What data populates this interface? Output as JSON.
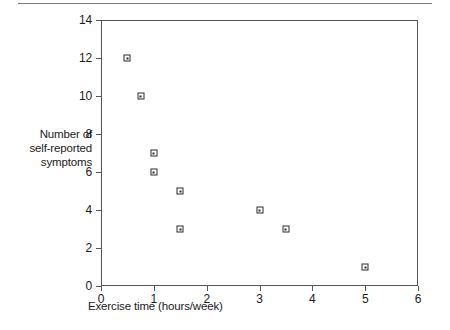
{
  "figure": {
    "top_rule": "horizontal-rule"
  },
  "chart_data": {
    "type": "scatter",
    "title": "",
    "xlabel": "Exercise time (hours/week)",
    "ylabel": "Number of\nself-reported\nsymptoms",
    "ylabel_lines": [
      "Number of",
      "self-reported",
      "symptoms"
    ],
    "xlim": [
      0,
      6
    ],
    "ylim": [
      0,
      14
    ],
    "xticks": [
      0,
      1,
      2,
      3,
      4,
      5,
      6
    ],
    "yticks": [
      0,
      2,
      4,
      6,
      8,
      10,
      12,
      14
    ],
    "xtick_labels": [
      "0",
      "1",
      "2",
      "3",
      "4",
      "5",
      "6"
    ],
    "ytick_labels": [
      "0",
      "2",
      "4",
      "6",
      "8",
      "10",
      "12",
      "14"
    ],
    "grid": false,
    "legend": null,
    "marker": "open-square",
    "marker_color": "#2b2b2b",
    "series": [
      {
        "name": "participants",
        "points": [
          {
            "x": 0.5,
            "y": 12
          },
          {
            "x": 0.75,
            "y": 10
          },
          {
            "x": 1.0,
            "y": 7
          },
          {
            "x": 1.0,
            "y": 6
          },
          {
            "x": 1.5,
            "y": 5
          },
          {
            "x": 1.5,
            "y": 3
          },
          {
            "x": 3.0,
            "y": 4
          },
          {
            "x": 3.5,
            "y": 3
          },
          {
            "x": 5.0,
            "y": 1
          }
        ]
      }
    ]
  }
}
